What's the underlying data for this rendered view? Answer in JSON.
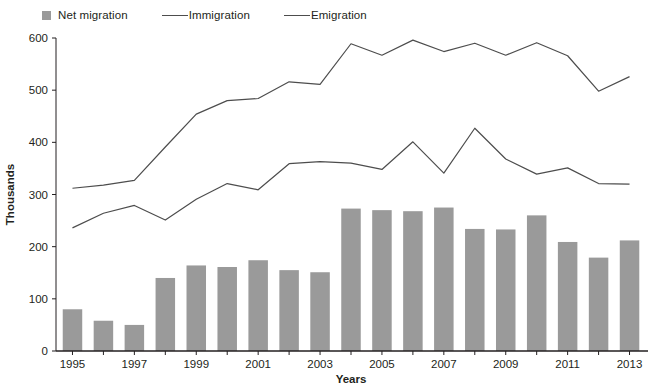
{
  "legend": {
    "items": [
      {
        "label": "Net migration",
        "marker": "square-swatch",
        "color": "#9a9a9a"
      },
      {
        "label": "Immigration",
        "marker": "line-swatch",
        "color": "#4d4d4d"
      },
      {
        "label": "Emigration",
        "marker": "line-swatch",
        "color": "#4d4d4d"
      }
    ]
  },
  "axes": {
    "y_title": "Thousands",
    "x_title": "Years",
    "y_ticks": [
      "0",
      "100",
      "200",
      "300",
      "400",
      "500",
      "600"
    ],
    "x_ticks": [
      "1995",
      "1997",
      "1999",
      "2001",
      "2003",
      "2005",
      "2007",
      "2009",
      "2011",
      "2013"
    ]
  },
  "chart_data": {
    "type": "bar",
    "title": "",
    "xlabel": "Years",
    "ylabel": "Thousands",
    "ylim": [
      0,
      600
    ],
    "grid": false,
    "legend_position": "top-left",
    "categories": [
      "1995",
      "1996",
      "1997",
      "1998",
      "1999",
      "2000",
      "2001",
      "2002",
      "2003",
      "2004",
      "2005",
      "2006",
      "2007",
      "2008",
      "2009",
      "2010",
      "2011",
      "2012",
      "2013"
    ],
    "series": [
      {
        "name": "Net migration",
        "type": "bar",
        "color": "#9a9a9a",
        "values": [
          80,
          58,
          50,
          140,
          164,
          161,
          174,
          155,
          151,
          273,
          270,
          268,
          275,
          234,
          233,
          260,
          209,
          179,
          212
        ]
      },
      {
        "name": "Immigration",
        "type": "line",
        "color": "#4d4d4d",
        "values": [
          312,
          318,
          327,
          391,
          454,
          480,
          484,
          516,
          511,
          589,
          567,
          596,
          574,
          590,
          567,
          591,
          566,
          498,
          526
        ]
      },
      {
        "name": "Emigration",
        "type": "line",
        "color": "#4d4d4d",
        "values": [
          236,
          264,
          279,
          251,
          291,
          321,
          309,
          359,
          363,
          360,
          348,
          401,
          341,
          427,
          368,
          339,
          351,
          321,
          320
        ]
      }
    ]
  }
}
